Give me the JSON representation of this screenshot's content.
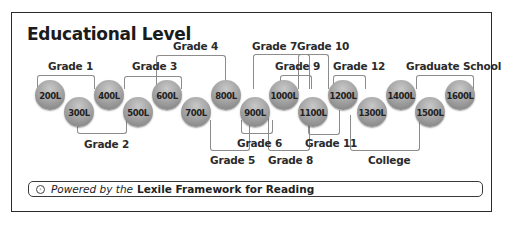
{
  "title": "Educational Level",
  "lexile_levels": [
    "200L",
    "300L",
    "400L",
    "500L",
    "600L",
    "700L",
    "800L",
    "900L",
    "1000L",
    "1100L",
    "1200L",
    "1300L",
    "1400L",
    "1500L",
    "1600L"
  ],
  "grades": {
    "grade1": "Grade 1",
    "grade2": "Grade 2",
    "grade3": "Grade 3",
    "grade4": "Grade 4",
    "grade5": "Grade 5",
    "grade6": "Grade 6",
    "grade7": "Grade 7",
    "grade8": "Grade 8",
    "grade9": "Grade 9",
    "grade10": "Grade 10",
    "grade11": "Grade 11",
    "grade12": "Grade 12",
    "college": "College",
    "graduate": "Graduate School"
  },
  "footer": {
    "icon": "circle-arrow-icon",
    "prefix": "Powered by the",
    "brand": "Lexile Framework for Reading"
  },
  "colors": {
    "border": "#2a2a2a",
    "bracket": "#8c8c8c",
    "circle": "#a6a6a6"
  }
}
